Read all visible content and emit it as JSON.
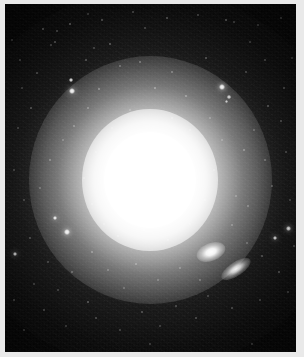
{
  "image": {
    "kind": "astronomical-photograph",
    "subject": "bright elliptical galaxy with diffuse halo",
    "caption": "",
    "frame_color": "#e9e9e9",
    "sky_color": "#050505",
    "star_color": "#ffffff",
    "width": 304,
    "height": 357
  },
  "plate": {
    "left": 5,
    "top": 4,
    "width": 291,
    "height": 348
  },
  "galaxy": {
    "name": "main-elliptical-galaxy",
    "center_x": 150,
    "center_y": 180,
    "core_radius": 46,
    "halo_radius": 150,
    "core_color": "#ffffff"
  },
  "companions": [
    {
      "name": "companion-galaxy-upper",
      "center_x": 211,
      "center_y": 252,
      "major": 30,
      "minor": 18,
      "angle": -22
    },
    {
      "name": "companion-galaxy-lower",
      "center_x": 236,
      "center_y": 269,
      "major": 34,
      "minor": 14,
      "angle": -34
    }
  ],
  "stars": [
    {
      "x": 71,
      "y": 80,
      "r": 2.0,
      "b": 0.92
    },
    {
      "x": 72,
      "y": 91,
      "r": 3.0,
      "b": 1.0
    },
    {
      "x": 55,
      "y": 218,
      "r": 2.4,
      "b": 0.95
    },
    {
      "x": 67,
      "y": 232,
      "r": 2.6,
      "b": 0.97
    },
    {
      "x": 15,
      "y": 254,
      "r": 2.2,
      "b": 0.92
    },
    {
      "x": 222,
      "y": 87,
      "r": 2.6,
      "b": 0.98
    },
    {
      "x": 288,
      "y": 228,
      "r": 2.5,
      "b": 0.96
    },
    {
      "x": 275,
      "y": 238,
      "r": 2.2,
      "b": 0.92
    },
    {
      "x": 229,
      "y": 97,
      "r": 1.8,
      "b": 0.8
    },
    {
      "x": 226,
      "y": 101,
      "r": 1.5,
      "b": 0.7
    },
    {
      "x": 43,
      "y": 29,
      "r": 1.3,
      "b": 0.62
    },
    {
      "x": 57,
      "y": 31,
      "r": 1.1,
      "b": 0.52
    },
    {
      "x": 70,
      "y": 24,
      "r": 1.4,
      "b": 0.66
    },
    {
      "x": 55,
      "y": 42,
      "r": 1.2,
      "b": 0.58
    },
    {
      "x": 51,
      "y": 45,
      "r": 1.0,
      "b": 0.46
    },
    {
      "x": 102,
      "y": 20,
      "r": 1.2,
      "b": 0.58
    },
    {
      "x": 133,
      "y": 12,
      "r": 1.1,
      "b": 0.5
    },
    {
      "x": 145,
      "y": 28,
      "r": 1.0,
      "b": 0.44
    },
    {
      "x": 167,
      "y": 18,
      "r": 1.2,
      "b": 0.56
    },
    {
      "x": 198,
      "y": 15,
      "r": 1.1,
      "b": 0.48
    },
    {
      "x": 226,
      "y": 20,
      "r": 1.3,
      "b": 0.62
    },
    {
      "x": 234,
      "y": 22,
      "r": 1.0,
      "b": 0.44
    },
    {
      "x": 258,
      "y": 25,
      "r": 1.0,
      "b": 0.42
    },
    {
      "x": 281,
      "y": 18,
      "r": 1.1,
      "b": 0.48
    },
    {
      "x": 20,
      "y": 60,
      "r": 1.0,
      "b": 0.44
    },
    {
      "x": 37,
      "y": 73,
      "r": 1.1,
      "b": 0.5
    },
    {
      "x": 31,
      "y": 108,
      "r": 1.2,
      "b": 0.54
    },
    {
      "x": 18,
      "y": 128,
      "r": 1.0,
      "b": 0.44
    },
    {
      "x": 86,
      "y": 60,
      "r": 1.1,
      "b": 0.5
    },
    {
      "x": 94,
      "y": 48,
      "r": 1.0,
      "b": 0.44
    },
    {
      "x": 110,
      "y": 44,
      "r": 1.2,
      "b": 0.56
    },
    {
      "x": 120,
      "y": 66,
      "r": 1.1,
      "b": 0.5
    },
    {
      "x": 99,
      "y": 89,
      "r": 1.2,
      "b": 0.58
    },
    {
      "x": 88,
      "y": 108,
      "r": 1.1,
      "b": 0.52
    },
    {
      "x": 74,
      "y": 126,
      "r": 1.1,
      "b": 0.5
    },
    {
      "x": 63,
      "y": 140,
      "r": 1.0,
      "b": 0.44
    },
    {
      "x": 140,
      "y": 62,
      "r": 1.1,
      "b": 0.52
    },
    {
      "x": 155,
      "y": 88,
      "r": 1.2,
      "b": 0.6
    },
    {
      "x": 172,
      "y": 72,
      "r": 1.1,
      "b": 0.52
    },
    {
      "x": 186,
      "y": 96,
      "r": 1.2,
      "b": 0.58
    },
    {
      "x": 206,
      "y": 58,
      "r": 1.1,
      "b": 0.5
    },
    {
      "x": 246,
      "y": 72,
      "r": 1.0,
      "b": 0.44
    },
    {
      "x": 265,
      "y": 60,
      "r": 1.1,
      "b": 0.48
    },
    {
      "x": 284,
      "y": 88,
      "r": 1.1,
      "b": 0.5
    },
    {
      "x": 268,
      "y": 106,
      "r": 1.2,
      "b": 0.56
    },
    {
      "x": 281,
      "y": 121,
      "r": 1.1,
      "b": 0.5
    },
    {
      "x": 254,
      "y": 130,
      "r": 1.0,
      "b": 0.42
    },
    {
      "x": 244,
      "y": 150,
      "r": 1.2,
      "b": 0.56
    },
    {
      "x": 265,
      "y": 160,
      "r": 1.1,
      "b": 0.48
    },
    {
      "x": 286,
      "y": 152,
      "r": 1.0,
      "b": 0.44
    },
    {
      "x": 272,
      "y": 186,
      "r": 1.1,
      "b": 0.5
    },
    {
      "x": 290,
      "y": 200,
      "r": 1.0,
      "b": 0.44
    },
    {
      "x": 248,
      "y": 206,
      "r": 1.1,
      "b": 0.5
    },
    {
      "x": 236,
      "y": 196,
      "r": 1.0,
      "b": 0.42
    },
    {
      "x": 232,
      "y": 225,
      "r": 1.1,
      "b": 0.48
    },
    {
      "x": 247,
      "y": 243,
      "r": 1.0,
      "b": 0.42
    },
    {
      "x": 262,
      "y": 256,
      "r": 1.1,
      "b": 0.48
    },
    {
      "x": 279,
      "y": 272,
      "r": 1.2,
      "b": 0.56
    },
    {
      "x": 288,
      "y": 292,
      "r": 1.0,
      "b": 0.44
    },
    {
      "x": 260,
      "y": 300,
      "r": 1.0,
      "b": 0.42
    },
    {
      "x": 232,
      "y": 308,
      "r": 1.1,
      "b": 0.48
    },
    {
      "x": 208,
      "y": 296,
      "r": 1.0,
      "b": 0.42
    },
    {
      "x": 196,
      "y": 318,
      "r": 1.1,
      "b": 0.48
    },
    {
      "x": 176,
      "y": 306,
      "r": 1.0,
      "b": 0.42
    },
    {
      "x": 160,
      "y": 326,
      "r": 1.0,
      "b": 0.4
    },
    {
      "x": 142,
      "y": 312,
      "r": 1.1,
      "b": 0.48
    },
    {
      "x": 120,
      "y": 330,
      "r": 1.0,
      "b": 0.42
    },
    {
      "x": 96,
      "y": 318,
      "r": 1.1,
      "b": 0.46
    },
    {
      "x": 88,
      "y": 302,
      "r": 1.2,
      "b": 0.56
    },
    {
      "x": 66,
      "y": 326,
      "r": 1.0,
      "b": 0.42
    },
    {
      "x": 44,
      "y": 310,
      "r": 1.1,
      "b": 0.48
    },
    {
      "x": 24,
      "y": 330,
      "r": 1.0,
      "b": 0.42
    },
    {
      "x": 14,
      "y": 300,
      "r": 1.1,
      "b": 0.46
    },
    {
      "x": 34,
      "y": 284,
      "r": 1.0,
      "b": 0.42
    },
    {
      "x": 58,
      "y": 290,
      "r": 1.0,
      "b": 0.4
    },
    {
      "x": 72,
      "y": 272,
      "r": 1.1,
      "b": 0.48
    },
    {
      "x": 48,
      "y": 262,
      "r": 1.0,
      "b": 0.42
    },
    {
      "x": 30,
      "y": 238,
      "r": 1.1,
      "b": 0.48
    },
    {
      "x": 92,
      "y": 252,
      "r": 1.1,
      "b": 0.5
    },
    {
      "x": 108,
      "y": 270,
      "r": 1.0,
      "b": 0.44
    },
    {
      "x": 124,
      "y": 288,
      "r": 1.0,
      "b": 0.42
    },
    {
      "x": 136,
      "y": 264,
      "r": 1.1,
      "b": 0.5
    },
    {
      "x": 158,
      "y": 280,
      "r": 1.0,
      "b": 0.44
    },
    {
      "x": 180,
      "y": 268,
      "r": 1.1,
      "b": 0.48
    },
    {
      "x": 200,
      "y": 280,
      "r": 1.0,
      "b": 0.42
    },
    {
      "x": 118,
      "y": 236,
      "r": 1.0,
      "b": 0.46
    },
    {
      "x": 144,
      "y": 230,
      "r": 1.0,
      "b": 0.46
    },
    {
      "x": 168,
      "y": 240,
      "r": 1.0,
      "b": 0.46
    },
    {
      "x": 190,
      "y": 224,
      "r": 1.0,
      "b": 0.44
    },
    {
      "x": 205,
      "y": 200,
      "r": 1.0,
      "b": 0.44
    },
    {
      "x": 214,
      "y": 170,
      "r": 1.0,
      "b": 0.42
    },
    {
      "x": 222,
      "y": 140,
      "r": 1.0,
      "b": 0.42
    },
    {
      "x": 210,
      "y": 118,
      "r": 1.0,
      "b": 0.44
    },
    {
      "x": 190,
      "y": 130,
      "r": 0.9,
      "b": 0.4
    },
    {
      "x": 172,
      "y": 118,
      "r": 0.9,
      "b": 0.4
    },
    {
      "x": 130,
      "y": 110,
      "r": 0.9,
      "b": 0.4
    },
    {
      "x": 112,
      "y": 128,
      "r": 0.9,
      "b": 0.38
    },
    {
      "x": 96,
      "y": 152,
      "r": 0.9,
      "b": 0.38
    },
    {
      "x": 84,
      "y": 178,
      "r": 0.9,
      "b": 0.4
    },
    {
      "x": 92,
      "y": 204,
      "r": 0.9,
      "b": 0.38
    },
    {
      "x": 104,
      "y": 224,
      "r": 0.9,
      "b": 0.38
    },
    {
      "x": 50,
      "y": 160,
      "r": 1.1,
      "b": 0.5
    },
    {
      "x": 40,
      "y": 188,
      "r": 1.0,
      "b": 0.44
    },
    {
      "x": 24,
      "y": 200,
      "r": 1.0,
      "b": 0.42
    },
    {
      "x": 14,
      "y": 170,
      "r": 1.0,
      "b": 0.44
    },
    {
      "x": 22,
      "y": 88,
      "r": 1.0,
      "b": 0.42
    },
    {
      "x": 12,
      "y": 40,
      "r": 1.0,
      "b": 0.42
    },
    {
      "x": 88,
      "y": 14,
      "r": 1.0,
      "b": 0.42
    },
    {
      "x": 250,
      "y": 42,
      "r": 1.0,
      "b": 0.42
    },
    {
      "x": 292,
      "y": 58,
      "r": 1.0,
      "b": 0.4
    },
    {
      "x": 294,
      "y": 246,
      "r": 1.1,
      "b": 0.46
    },
    {
      "x": 150,
      "y": 344,
      "r": 1.0,
      "b": 0.4
    },
    {
      "x": 252,
      "y": 344,
      "r": 1.0,
      "b": 0.4
    }
  ]
}
